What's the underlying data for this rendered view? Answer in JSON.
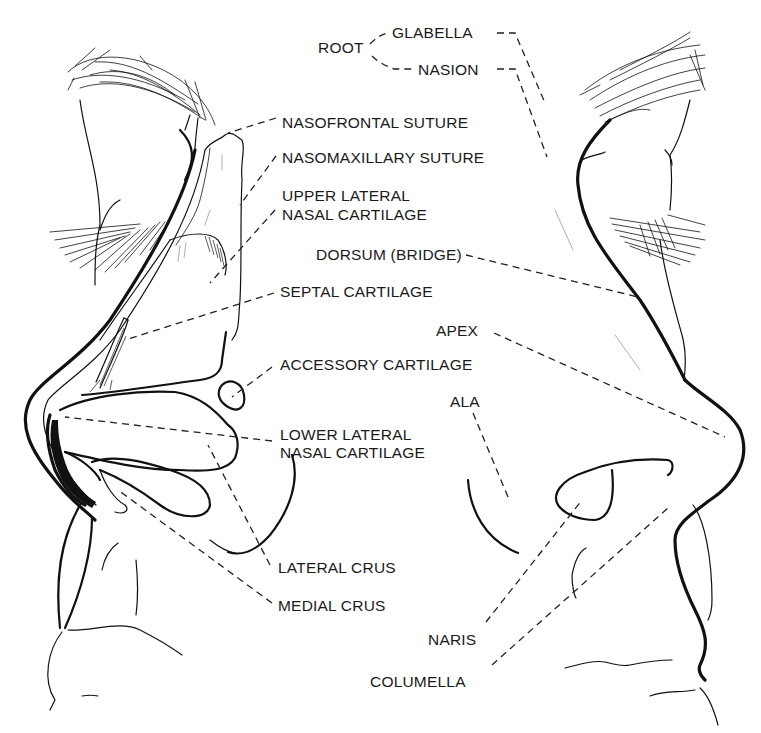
{
  "diagram": {
    "type": "anatomical-line-drawing",
    "colors": {
      "line": "#111111",
      "background": "#ffffff",
      "label": "#1a1a1a"
    }
  },
  "labels": {
    "root": "ROOT",
    "glabella": "GLABELLA",
    "nasion": "NASION",
    "nasofrontal_suture": "NASOFRONTAL SUTURE",
    "nasomaxillary_suture": "NASOMAXILLARY SUTURE",
    "upper_lateral_1": "UPPER LATERAL",
    "upper_lateral_2": "NASAL CARTILAGE",
    "dorsum": "DORSUM (BRIDGE)",
    "septal_cartilage": "SEPTAL CARTILAGE",
    "apex": "APEX",
    "accessory_cartilage": "ACCESSORY CARTILAGE",
    "ala": "ALA",
    "lower_lateral_1": "LOWER LATERAL",
    "lower_lateral_2": "NASAL CARTILAGE",
    "lateral_crus": "LATERAL CRUS",
    "medial_crus": "MEDIAL CRUS",
    "naris": "NARIS",
    "columella": "COLUMELLA"
  }
}
